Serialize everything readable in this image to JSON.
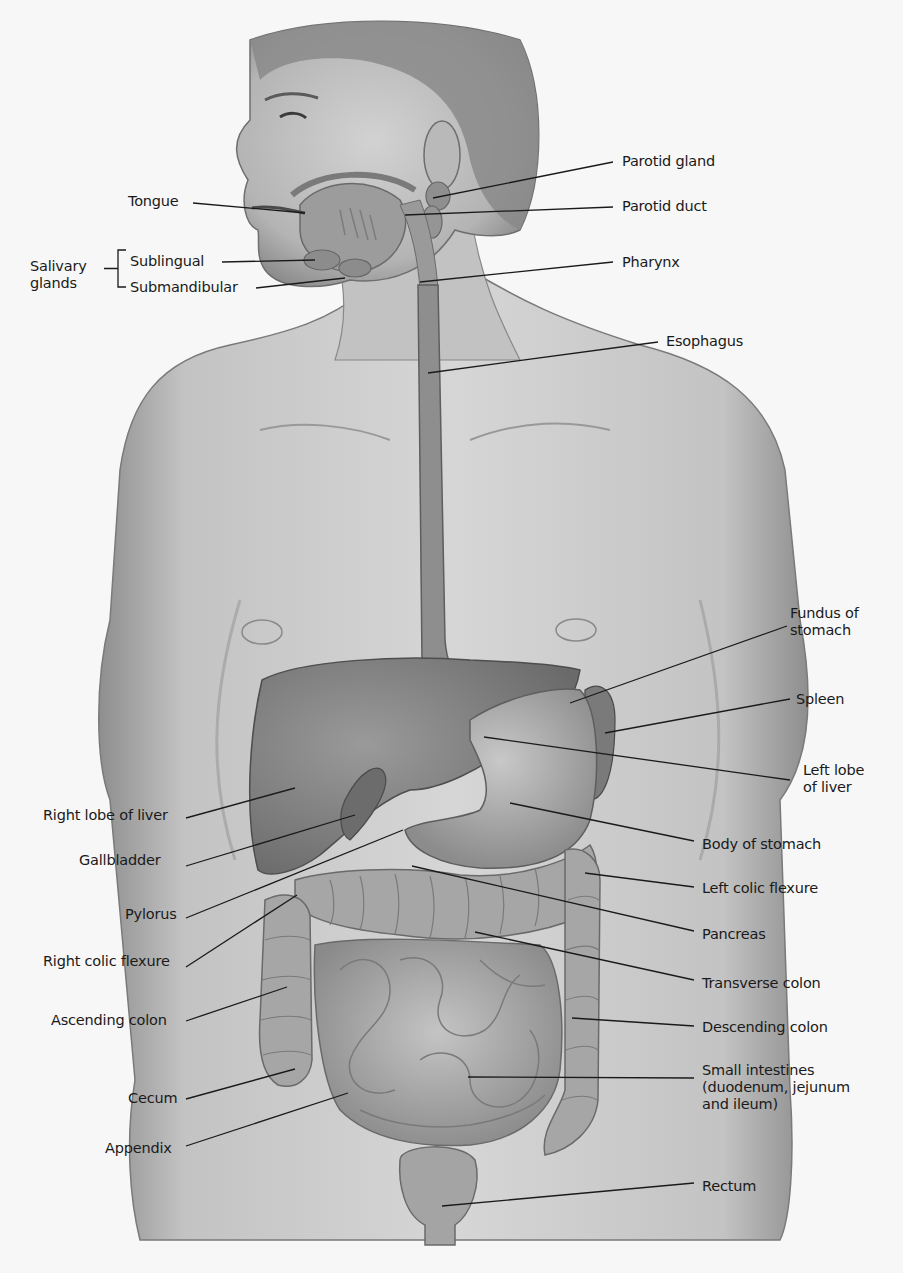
{
  "diagram": {
    "type": "anatomical-illustration",
    "colors": {
      "background": "#f7f7f7",
      "skin": "#c9c9c9",
      "skin_shadow": "#8f8f8f",
      "organ": "#8a8a8a",
      "organ_dark": "#6e6e6e",
      "intestine": "#a8a8a8",
      "leader_line": "#1a1a1a",
      "text": "#1a1a1a"
    },
    "left_labels": [
      {
        "id": "tongue",
        "text": "Tongue",
        "x": 128,
        "y": 193,
        "line": [
          193,
          203,
          305,
          213
        ]
      },
      {
        "id": "sublingual",
        "text": "Sublingual",
        "x": 130,
        "y": 253,
        "line": [
          222,
          262,
          315,
          260
        ]
      },
      {
        "id": "submandibular",
        "text": "Submandibular",
        "x": 130,
        "y": 279,
        "line": [
          256,
          288,
          345,
          278
        ]
      },
      {
        "id": "right-lobe-of-liver",
        "text": "Right lobe of liver",
        "x": 43,
        "y": 807,
        "line": [
          186,
          818,
          295,
          788
        ]
      },
      {
        "id": "gallbladder",
        "text": "Gallbladder",
        "x": 79,
        "y": 852,
        "line": [
          186,
          866,
          355,
          815
        ]
      },
      {
        "id": "pylorus",
        "text": "Pylorus",
        "x": 125,
        "y": 906,
        "line": [
          186,
          918,
          403,
          830
        ]
      },
      {
        "id": "right-colic-flexure",
        "text": "Right colic flexure",
        "x": 43,
        "y": 953,
        "line": [
          186,
          967,
          297,
          895
        ]
      },
      {
        "id": "ascending-colon",
        "text": "Ascending colon",
        "x": 51,
        "y": 1012,
        "line": [
          186,
          1021,
          287,
          987
        ]
      },
      {
        "id": "cecum",
        "text": "Cecum",
        "x": 128,
        "y": 1090,
        "line": [
          186,
          1099,
          295,
          1069
        ]
      },
      {
        "id": "appendix",
        "text": "Appendix",
        "x": 105,
        "y": 1140,
        "line": [
          186,
          1146,
          348,
          1093
        ]
      }
    ],
    "salivary_group": {
      "text": "Salivary\nglands",
      "x": 30,
      "y": 258,
      "bracket_x": 118,
      "bracket_top": 250,
      "bracket_bottom": 287
    },
    "right_labels": [
      {
        "id": "parotid-gland",
        "text": "Parotid gland",
        "x": 622,
        "y": 153,
        "line": [
          613,
          162,
          433,
          198
        ]
      },
      {
        "id": "parotid-duct",
        "text": "Parotid duct",
        "x": 622,
        "y": 198,
        "line": [
          613,
          207,
          405,
          215
        ]
      },
      {
        "id": "pharynx",
        "text": "Pharynx",
        "x": 622,
        "y": 254,
        "line": [
          613,
          262,
          420,
          282
        ]
      },
      {
        "id": "esophagus",
        "text": "Esophagus",
        "x": 666,
        "y": 333,
        "line": [
          658,
          342,
          428,
          373
        ]
      },
      {
        "id": "fundus-of-stomach",
        "text": "Fundus of\nstomach",
        "x": 790,
        "y": 605,
        "line": [
          787,
          626,
          570,
          703
        ]
      },
      {
        "id": "spleen",
        "text": "Spleen",
        "x": 796,
        "y": 691,
        "line": [
          790,
          699,
          605,
          733
        ]
      },
      {
        "id": "left-lobe-of-liver",
        "text": "Left lobe\nof liver",
        "x": 803,
        "y": 762,
        "line": [
          790,
          780,
          484,
          737
        ]
      },
      {
        "id": "body-of-stomach",
        "text": "Body of stomach",
        "x": 702,
        "y": 836,
        "line": [
          694,
          841,
          510,
          803
        ]
      },
      {
        "id": "left-colic-flexure",
        "text": "Left colic flexure",
        "x": 702,
        "y": 880,
        "line": [
          694,
          887,
          585,
          873
        ]
      },
      {
        "id": "pancreas",
        "text": "Pancreas",
        "x": 702,
        "y": 926,
        "line": [
          694,
          931,
          412,
          866
        ]
      },
      {
        "id": "transverse-colon",
        "text": "Transverse colon",
        "x": 702,
        "y": 975,
        "line": [
          694,
          980,
          475,
          932
        ]
      },
      {
        "id": "descending-colon",
        "text": "Descending colon",
        "x": 702,
        "y": 1019,
        "line": [
          694,
          1026,
          572,
          1018
        ]
      },
      {
        "id": "small-intestines",
        "text": "Small intestines\n(duodenum, jejunum\nand ileum)",
        "x": 702,
        "y": 1062,
        "line": [
          694,
          1078,
          468,
          1077
        ]
      },
      {
        "id": "rectum",
        "text": "Rectum",
        "x": 702,
        "y": 1178,
        "line": [
          694,
          1183,
          442,
          1206
        ]
      }
    ]
  }
}
